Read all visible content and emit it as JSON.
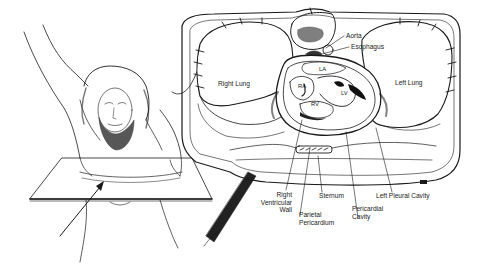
{
  "figure": {
    "ink_color": "#1a1a1a",
    "paper_color": "#ffffff"
  },
  "labels": {
    "aorta": "Aorta",
    "esophagus": "Esophagus",
    "right_lung": "Right Lung",
    "left_lung": "Left Lung",
    "la": "LA",
    "ra": "RA",
    "rv": "RV",
    "lv": "LV",
    "right_ventricular_wall": "Right\nVentricular\nWall",
    "sternum": "Sternum",
    "left_pleural_cavity": "Left Pleural Cavity",
    "parietal_pericardium": "Parietal\nPericardium",
    "pericardial_cavity": "Pericardial\nCavity"
  }
}
